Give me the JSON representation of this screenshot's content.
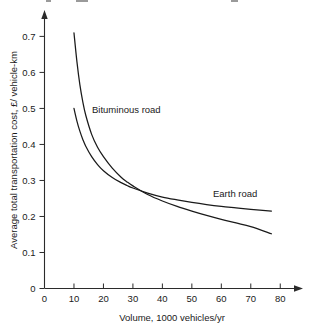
{
  "chart_data": {
    "type": "line",
    "title": "",
    "xlabel": "Volume, 1000 vehicles/yr",
    "ylabel": "Average total transportation cost, £/ vehicle-km",
    "xlim": [
      0,
      85
    ],
    "ylim": [
      0,
      0.74
    ],
    "xticks": [
      0,
      10,
      20,
      30,
      40,
      50,
      60,
      70,
      80
    ],
    "xtick_labels": [
      "0",
      "10",
      "20",
      "30",
      "40",
      "50",
      "60",
      "70",
      "80"
    ],
    "yticks": [
      0,
      0.1,
      0.2,
      0.3,
      0.4,
      0.5,
      0.6,
      0.7
    ],
    "ytick_labels": [
      "0",
      "0.1",
      "0.2",
      "0.3",
      "0.4",
      "0.5",
      "0.6",
      "0.7"
    ],
    "grid": false,
    "legend_position": "inline-annotation",
    "axis_arrows": true,
    "series": [
      {
        "name": "Bituminous road",
        "label_x": 33,
        "label_y": 0.455,
        "x": [
          10,
          11,
          12,
          13,
          14,
          16,
          18,
          20,
          23,
          26,
          28,
          30,
          35,
          40,
          45,
          50,
          55,
          60,
          65,
          70,
          77
        ],
        "values": [
          0.71,
          0.63,
          0.566,
          0.518,
          0.481,
          0.428,
          0.392,
          0.366,
          0.334,
          0.309,
          0.296,
          0.285,
          0.261,
          0.243,
          0.228,
          0.215,
          0.203,
          0.192,
          0.182,
          0.172,
          0.152
        ]
      },
      {
        "name": "Earth road",
        "label_x": 64,
        "label_y": 0.243,
        "x": [
          10,
          11,
          12,
          13,
          14,
          16,
          18,
          20,
          23,
          26,
          28,
          30,
          35,
          40,
          45,
          50,
          55,
          60,
          65,
          70,
          77
        ],
        "values": [
          0.5,
          0.465,
          0.437,
          0.414,
          0.395,
          0.366,
          0.344,
          0.327,
          0.308,
          0.294,
          0.286,
          0.279,
          0.265,
          0.254,
          0.246,
          0.239,
          0.233,
          0.228,
          0.224,
          0.22,
          0.215
        ]
      }
    ],
    "annotations": [
      {
        "text": "Bituminous road",
        "x": 33,
        "y": 0.455
      },
      {
        "text": "Earth road",
        "x": 64,
        "y": 0.243
      }
    ],
    "intersection": {
      "x": 28,
      "y": 0.29
    }
  }
}
